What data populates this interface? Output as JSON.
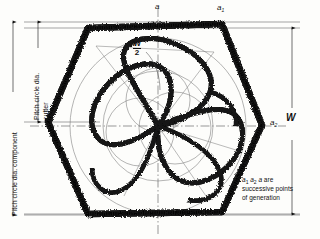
{
  "figure": {
    "type": "engineering-drawing",
    "background_color": "#fdfdfb",
    "ink_color": "#111111"
  },
  "labels": {
    "apex_top": "a",
    "apex_upper_right": "a",
    "apex_upper_right_sub": "1",
    "apex_right": "a",
    "apex_right_sub": "2",
    "width_overall": "W",
    "half_width_num": "W",
    "half_width_den": "2",
    "dim_component": "Pitch circle dia. component",
    "dim_cutter_line1": "Pitch circle dia.",
    "dim_cutter_line2": "cutter"
  },
  "note": {
    "line1_a": "a",
    "line1_a_sub": "1",
    "line1_b": "a",
    "line1_b_sub": "2",
    "line1_c": "a",
    "line1_tail": " are",
    "line2": "successive points",
    "line3": "of generation"
  },
  "geometry": {
    "center_x": 158,
    "center_y": 126,
    "hexagon_vertices": "left(48,122) upper-left(88,28) upper-right(222,24) right(262,125) lower-right(222,212) lower-left(88,214)",
    "hex_stroke_width": 7,
    "cutter_lobes": 3,
    "cutter_positions": 3,
    "pitch_circle_component_radius": 94,
    "pitch_circle_cutter_radius": 47,
    "dim_w_top_y": 28,
    "dim_w_bottom_y": 214,
    "dim_component_top_y": 22,
    "dim_component_bottom_y": 215,
    "dim_cutter_top_y": 22,
    "dim_cutter_bottom_y": 122
  }
}
